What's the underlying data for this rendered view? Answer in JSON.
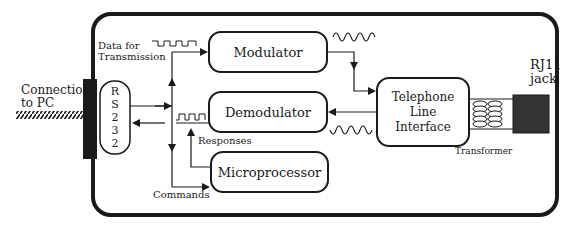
{
  "diagram": {
    "labels": {
      "connection": "Connection\nto PC",
      "rj11": "RJ11\njack",
      "data_for_transmission": "Data for\nTransmission",
      "responses": "Responses",
      "commands": "Commands",
      "transformer": "Transformer"
    },
    "blocks": {
      "rs232": "R\nS\n2\n3\n2",
      "modulator": "Modulator",
      "demodulator": "Demodulator",
      "microprocessor": "Microprocessor",
      "telephone_line_interface": "Telephone\nLine\nInterface"
    },
    "colors": {
      "line": "#1a1a1a",
      "jack_fill": "#333333",
      "background": "#ffffff"
    }
  }
}
